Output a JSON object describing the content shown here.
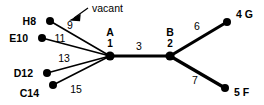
{
  "diagram": {
    "type": "tree-graph",
    "background_color": "#ffffff",
    "stroke_color": "#000000",
    "annotation": {
      "text": "vacant",
      "target_edge_label": "9",
      "arrow_direction": "down-left"
    },
    "nodes": [
      {
        "id": "H8",
        "label": "H8",
        "x": 50,
        "y": 21,
        "label_x": 36,
        "label_y": 17,
        "label_anchor": "end",
        "radius": 4.0,
        "kind": "leaf"
      },
      {
        "id": "E10",
        "label": "E10",
        "x": 42,
        "y": 38,
        "label_x": 28,
        "label_y": 42,
        "label_anchor": "end",
        "radius": 4.0,
        "kind": "leaf"
      },
      {
        "id": "D12",
        "label": "D12",
        "x": 47,
        "y": 73,
        "label_x": 33,
        "label_y": 77,
        "label_anchor": "end",
        "radius": 4.0,
        "kind": "leaf"
      },
      {
        "id": "C14",
        "label": "C14",
        "x": 53,
        "y": 85,
        "label_x": 39,
        "label_y": 95,
        "label_anchor": "end",
        "radius": 4.0,
        "kind": "leaf"
      },
      {
        "id": "A",
        "label": "A",
        "x": 110,
        "y": 56,
        "label_x": 110,
        "label_y": 36,
        "label_anchor": "middle",
        "radius": 4.6,
        "kind": "center",
        "sublabel": "1",
        "sublabel_x": 110,
        "sublabel_y": 47
      },
      {
        "id": "B",
        "label": "B",
        "x": 170,
        "y": 56,
        "label_x": 170,
        "label_y": 36,
        "label_anchor": "middle",
        "radius": 4.6,
        "kind": "center",
        "sublabel": "2",
        "sublabel_x": 170,
        "sublabel_y": 47
      },
      {
        "id": "4G",
        "label": "4 G",
        "x": 227,
        "y": 22,
        "label_x": 236,
        "label_y": 18,
        "label_anchor": "start",
        "radius": 4.0,
        "kind": "leaf"
      },
      {
        "id": "5F",
        "label": "5 F",
        "x": 225,
        "y": 88,
        "label_x": 234,
        "label_y": 95,
        "label_anchor": "start",
        "radius": 4.0,
        "kind": "leaf"
      }
    ],
    "edges": [
      {
        "id": "A-H8",
        "from": "A",
        "to": "H8",
        "label": "9",
        "label_x": 70,
        "label_y": 28,
        "weight": "thin",
        "vacant": true
      },
      {
        "id": "A-E10",
        "from": "A",
        "to": "E10",
        "label": "11",
        "label_x": 59,
        "label_y": 41,
        "weight": "thin",
        "vacant": false
      },
      {
        "id": "A-D12",
        "from": "A",
        "to": "D12",
        "label": "13",
        "label_x": 63,
        "label_y": 62,
        "weight": "thin",
        "vacant": false
      },
      {
        "id": "A-C14",
        "from": "A",
        "to": "C14",
        "label": "15",
        "label_x": 75,
        "label_y": 92,
        "weight": "thin",
        "vacant": false
      },
      {
        "id": "A-B",
        "from": "A",
        "to": "B",
        "label": "3",
        "label_x": 138,
        "label_y": 50,
        "weight": "thick",
        "vacant": false
      },
      {
        "id": "B-4G",
        "from": "B",
        "to": "4G",
        "label": "6",
        "label_x": 196,
        "label_y": 29,
        "weight": "thick",
        "vacant": false
      },
      {
        "id": "B-5F",
        "from": "B",
        "to": "5F",
        "label": "7",
        "label_x": 194,
        "label_y": 83,
        "weight": "thick",
        "vacant": false
      }
    ],
    "annotation_text_pos": {
      "x": 90,
      "y": 12
    },
    "arrow": {
      "tail_x": 88,
      "tail_y": 8,
      "head_x": 72,
      "head_y": 19
    }
  }
}
